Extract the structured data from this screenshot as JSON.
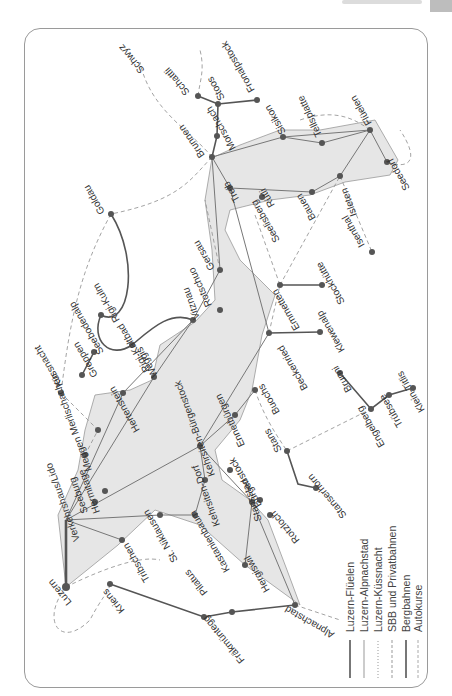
{
  "header": {
    "running_text": "Vierwaldstättersee"
  },
  "map": {
    "orientation_deg": 180,
    "colors": {
      "lake": "#e6e6e6",
      "route": "#777777",
      "bahn": "#555555",
      "node": "#555555",
      "dash": "#999999",
      "frame": "#9a9a9a"
    },
    "places": [
      {
        "id": "luzern",
        "label": "Luzern",
        "x": 66,
        "y": 587
      },
      {
        "id": "kriens",
        "label": "Kriens",
        "x": 110,
        "y": 584
      },
      {
        "id": "fraekmuentegg",
        "label": "Fräkmüntegg",
        "x": 204,
        "y": 617
      },
      {
        "id": "pilatus",
        "label": "Pilatus",
        "x": 190,
        "y": 565
      },
      {
        "id": "alpnachstad",
        "label": "Alpnachstad",
        "x": 295,
        "y": 605
      },
      {
        "id": "tribschen",
        "label": "Tribschen",
        "x": 122,
        "y": 540
      },
      {
        "id": "st-niklausen",
        "label": "St. Niklausen",
        "x": 160,
        "y": 515
      },
      {
        "id": "kastanienbaum",
        "label": "Kastanienbaum",
        "x": 195,
        "y": 515
      },
      {
        "id": "hergiswil",
        "label": "Hergiswil",
        "x": 245,
        "y": 565
      },
      {
        "id": "kehrsiten",
        "label": "Kehrsiten-Dorf",
        "x": 205,
        "y": 480
      },
      {
        "id": "rotzloch",
        "label": "Rotzloch",
        "x": 270,
        "y": 515
      },
      {
        "id": "stansstad",
        "label": "Stansstad",
        "x": 252,
        "y": 502
      },
      {
        "id": "buergenstock",
        "label": "Bürgenstock",
        "x": 230,
        "y": 470
      },
      {
        "id": "kehrsiten-buergenstock",
        "label": "Kehrsiten-Bürgenstock",
        "x": 213,
        "y": 448
      },
      {
        "id": "stans",
        "label": "Stans",
        "x": 287,
        "y": 451
      },
      {
        "id": "stanserhorn",
        "label": "Stanserhorn",
        "x": 298,
        "y": 484
      },
      {
        "id": "buochs",
        "label": "Buochs",
        "x": 255,
        "y": 390
      },
      {
        "id": "ennetbuergen",
        "label": "Ennetbürgen",
        "x": 235,
        "y": 415
      },
      {
        "id": "beckenried",
        "label": "Beckenried",
        "x": 269,
        "y": 333
      },
      {
        "id": "klewenalp",
        "label": "Klewenalp",
        "x": 320,
        "y": 332
      },
      {
        "id": "emmetten",
        "label": "Emmetten",
        "x": 280,
        "y": 285
      },
      {
        "id": "stockhuette",
        "label": "Stockhütte",
        "x": 322,
        "y": 285
      },
      {
        "id": "seelisberg",
        "label": "Seelisberg",
        "x": 255,
        "y": 215
      },
      {
        "id": "isenthal",
        "label": "Isenthal",
        "x": 372,
        "y": 252
      },
      {
        "id": "bauen",
        "label": "Bauen",
        "x": 312,
        "y": 192
      },
      {
        "id": "isleten",
        "label": "Isleten",
        "x": 340,
        "y": 176
      },
      {
        "id": "rueti",
        "label": "Rütli",
        "x": 262,
        "y": 197
      },
      {
        "id": "treib",
        "label": "Treib",
        "x": 230,
        "y": 188
      },
      {
        "id": "sisikon",
        "label": "Sisikon",
        "x": 283,
        "y": 137
      },
      {
        "id": "tellsplatte",
        "label": "Tellsplatte",
        "x": 322,
        "y": 143
      },
      {
        "id": "flueelen",
        "label": "Flüelen",
        "x": 370,
        "y": 130
      },
      {
        "id": "seedorf",
        "label": "Seedorf",
        "x": 387,
        "y": 162
      },
      {
        "id": "brunnen",
        "label": "Brunnen",
        "x": 212,
        "y": 157
      },
      {
        "id": "morschach",
        "label": "Morschach",
        "x": 217,
        "y": 136
      },
      {
        "id": "stoos",
        "label": "Stoos",
        "x": 218,
        "y": 104
      },
      {
        "id": "fronalpstock",
        "label": "Fronalpstock",
        "x": 257,
        "y": 100
      },
      {
        "id": "schatti",
        "label": "Schattli",
        "x": 198,
        "y": 96
      },
      {
        "id": "schwyz",
        "label": "Schwyz",
        "x": 140,
        "y": 62
      },
      {
        "id": "gersau",
        "label": "Gersau",
        "x": 220,
        "y": 270
      },
      {
        "id": "vitznau",
        "label": "Vitznau",
        "x": 193,
        "y": 320
      },
      {
        "id": "rotschuo",
        "label": "Rotschuo",
        "x": 218,
        "y": 308
      },
      {
        "id": "goldau",
        "label": "Goldau",
        "x": 111,
        "y": 214
      },
      {
        "id": "rigi-kulm",
        "label": "Rigi-Kulm",
        "x": 101,
        "y": 315
      },
      {
        "id": "rigi-kaltbad",
        "label": "Rigi-Kaltbad",
        "x": 132,
        "y": 345
      },
      {
        "id": "seebodenalp",
        "label": "Seebodenalp",
        "x": 94,
        "y": 352
      },
      {
        "id": "weggis",
        "label": "Weggis",
        "x": 154,
        "y": 377
      },
      {
        "id": "greppen",
        "label": "Greppen",
        "x": 82,
        "y": 375
      },
      {
        "id": "kuessnacht",
        "label": "Küssnacht",
        "x": 61,
        "y": 393
      },
      {
        "id": "hertenstein",
        "label": "Hertenstein",
        "x": 123,
        "y": 393
      },
      {
        "id": "kastanienbaum2",
        "label": "Kastanienbaum",
        "x": 175,
        "y": 400
      },
      {
        "id": "merlischachen",
        "label": "Meggen Merlischachen",
        "x": 98,
        "y": 430
      },
      {
        "id": "meggen",
        "label": "Meggen",
        "x": 85,
        "y": 455
      },
      {
        "id": "hermitage",
        "label": "Hermitage",
        "x": 105,
        "y": 491
      },
      {
        "id": "seeburg",
        "label": "Seeburg",
        "x": 95,
        "y": 502
      },
      {
        "id": "verkehrshaus",
        "label": "Verkehrshaus/Lido",
        "x": 78,
        "y": 510
      },
      {
        "id": "ettiswil-uri",
        "label": "Stanserhorn",
        "x": 0,
        "y": 0
      },
      {
        "id": "kernmatt",
        "label": "Kernmatt",
        "x": 0,
        "y": 0
      },
      {
        "id": "bruni",
        "label": "Brunni",
        "x": 340,
        "y": 373
      },
      {
        "id": "engelberg",
        "label": "Engelberg",
        "x": 371,
        "y": 409
      },
      {
        "id": "truebsee",
        "label": "Trübsee",
        "x": 389,
        "y": 395
      },
      {
        "id": "klein-titlis",
        "label": "Klein-Titlis",
        "x": 413,
        "y": 388
      }
    ]
  },
  "legend": {
    "items": [
      {
        "label": "Luzern-Flüelen",
        "style": "solid-dark"
      },
      {
        "label": "Luzern-Alpnachstad",
        "style": "solid-light"
      },
      {
        "label": "Luzern-Küssnacht",
        "style": "dotted"
      },
      {
        "label": "SBB und Privatbahnen",
        "style": "dashed"
      },
      {
        "label": "Bergbahnen",
        "style": "solid-dark"
      },
      {
        "label": "Autokurse",
        "style": "dashed-light"
      }
    ]
  }
}
